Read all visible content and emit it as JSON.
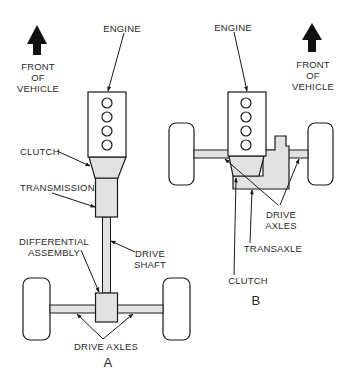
{
  "colors": {
    "line": "#1a1a1a",
    "fill_gray": "#e2e2e2",
    "fill_white": "#ffffff",
    "text": "#2a2a2a"
  },
  "diagram_a": {
    "caption": "A",
    "front_arrow": {
      "icon": "up-arrow-icon",
      "lines": [
        "FRONT",
        "OF",
        "VEHICLE"
      ]
    },
    "labels": {
      "engine": "ENGINE",
      "clutch": "CLUTCH",
      "transmission": "TRANSMISSION",
      "differential_line1": "DIFFERENTIAL",
      "differential_line2": "ASSEMBLY",
      "drive_shaft_line1": "DRIVE",
      "drive_shaft_line2": "SHAFT",
      "drive_axles": "DRIVE AXLES"
    }
  },
  "diagram_b": {
    "caption": "B",
    "front_arrow": {
      "icon": "up-arrow-icon",
      "lines": [
        "FRONT",
        "OF",
        "VEHICLE"
      ]
    },
    "labels": {
      "engine": "ENGINE",
      "drive_axles_line1": "DRIVE",
      "drive_axles_line2": "AXLES",
      "transaxle": "TRANSAXLE",
      "clutch": "CLUTCH"
    }
  }
}
